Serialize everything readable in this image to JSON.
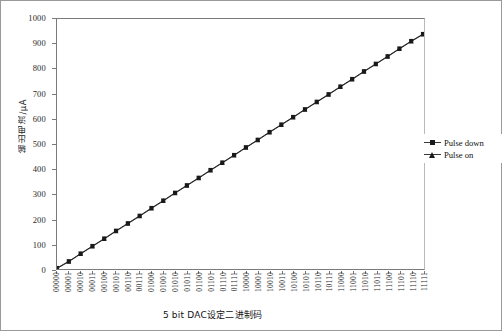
{
  "chart": {
    "title": "",
    "xlabel": "5 bit DAC设定二进制码",
    "ylabel": "输出电流/μA"
  },
  "legend": {
    "position": "right",
    "items": [
      {
        "label": "Pulse down",
        "marker": "square-marker-icon",
        "color": "#1a1a1a"
      },
      {
        "label": "Pulse on",
        "marker": "triangle-marker-icon",
        "color": "#1a1a1a"
      }
    ]
  },
  "chart_data": {
    "type": "line",
    "title": "",
    "xlabel": "5 bit DAC设定二进制码",
    "ylabel": "输出电流/μA",
    "ylim": [
      0,
      1000
    ],
    "yticks": [
      0,
      100,
      200,
      300,
      400,
      500,
      600,
      700,
      800,
      900,
      1000
    ],
    "grid": false,
    "legend_position": "right",
    "categories": [
      "00000",
      "00001",
      "00010",
      "00011",
      "00100",
      "00101",
      "00110",
      "00111",
      "01000",
      "01001",
      "01010",
      "01011",
      "01100",
      "01101",
      "01110",
      "01111",
      "10000",
      "10001",
      "10010",
      "10011",
      "10100",
      "10101",
      "10110",
      "10111",
      "11000",
      "11001",
      "11010",
      "11011",
      "11100",
      "11101",
      "11110",
      "11111"
    ],
    "series": [
      {
        "name": "Pulse down",
        "marker": "square",
        "color": "#1a1a1a",
        "values": [
          4,
          31,
          62,
          92,
          122,
          153,
          183,
          213,
          244,
          274,
          305,
          335,
          365,
          396,
          426,
          456,
          487,
          517,
          548,
          578,
          608,
          639,
          669,
          699,
          730,
          760,
          791,
          821,
          851,
          882,
          912,
          940
        ]
      },
      {
        "name": "Pulse on",
        "marker": "triangle",
        "color": "#1a1a1a",
        "values": [
          2,
          29,
          60,
          90,
          120,
          151,
          181,
          211,
          242,
          272,
          303,
          333,
          363,
          394,
          424,
          454,
          485,
          515,
          546,
          576,
          606,
          637,
          667,
          697,
          728,
          758,
          789,
          819,
          849,
          880,
          910,
          938
        ]
      }
    ]
  }
}
